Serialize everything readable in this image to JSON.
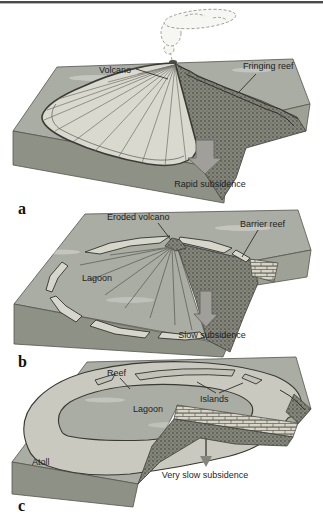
{
  "figure": {
    "panels": [
      {
        "letter": "a",
        "caption": "Rapid subsidence",
        "labels": {
          "volcano": "Volcano",
          "fringing_reef": "Fringing reef"
        }
      },
      {
        "letter": "b",
        "caption": "Slow subsidence",
        "labels": {
          "eroded_volcano": "Eroded volcano",
          "barrier_reef": "Barrier reef",
          "lagoon": "Lagoon"
        }
      },
      {
        "letter": "c",
        "caption": "Very slow subsidence",
        "labels": {
          "reef": "Reef",
          "islands": "Islands",
          "lagoon": "Lagoon",
          "atoll": "Atoll"
        }
      }
    ],
    "icons": {
      "subsidence_arrow": "block-arrow-down",
      "thin_arrow": "thin-arrow-down",
      "smoke_plume": "volcanic-eruption-cloud"
    },
    "colors": {
      "top_rule": "#4a4a4a",
      "sea_surface": "#a9ada3",
      "block_front": "#8e9186",
      "block_side": "#9da196",
      "cross_section_base": "#84867c",
      "stipple_dot": "#3a3b34",
      "volcano_fan": "#dad9d0",
      "reef_band": "#d6d6cc",
      "atoll_ring": "#c9c9c0",
      "limestone": "#d8d5c8",
      "arrow_fill": "#a09f9a",
      "outline": "#55554e",
      "text": "#1f1f1d"
    }
  }
}
